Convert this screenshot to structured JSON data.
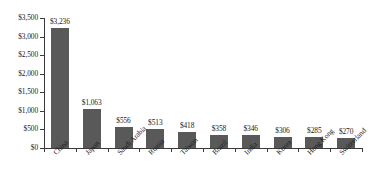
{
  "chart_data": {
    "type": "bar",
    "title": "",
    "subtitle": "",
    "xlabel": "",
    "ylabel": "",
    "ylim": [
      0,
      3500
    ],
    "grid": false,
    "legend": null,
    "value_prefix": "$",
    "categories": [
      "China",
      "Japan",
      "Saudi Arabia",
      "Russia",
      "Taiwan",
      "Brazil",
      "India",
      "Korea",
      "Hong Kong",
      "Switzerland"
    ],
    "values": [
      3236,
      1063,
      556,
      513,
      418,
      358,
      346,
      306,
      285,
      270
    ],
    "value_labels": [
      "$3,236",
      "$1,063",
      "$556",
      "$513",
      "$418",
      "$358",
      "$346",
      "$306",
      "$285",
      "$270"
    ],
    "y_ticks": [
      0,
      500,
      1000,
      1500,
      2000,
      2500,
      3000,
      3500
    ],
    "y_tick_labels": [
      "$0",
      "$500",
      "$1,000",
      "$1,500",
      "$2,000",
      "$2,500",
      "$3,000",
      "$3,500"
    ],
    "bar_color": "#595959",
    "axis_color": "#3a3a3a",
    "text_color": "#1a1a1a",
    "background_color": "#ffffff"
  }
}
